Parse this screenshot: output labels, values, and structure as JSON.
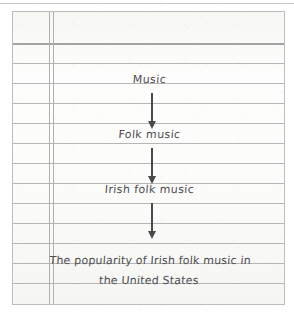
{
  "document": {
    "medium": "scanned lined notebook paper",
    "title_visible": false
  },
  "paper": {
    "ruled_line_count": 13,
    "ruled_line_spacing_px": 20,
    "first_rule_y_px": 31,
    "margin": {
      "style": "double vertical line",
      "x_positions_px": [
        36,
        40
      ]
    },
    "ink_color": "#4d4d52",
    "rule_color": "#b6b6b6",
    "paper_color": "#fdfdfc",
    "border_color": "#bdbdbd"
  },
  "diagram": {
    "type": "vertical-flow",
    "direction": "top-to-bottom narrowing of topic",
    "nodes": [
      {
        "id": "n1",
        "text": "Music"
      },
      {
        "id": "n2",
        "text": "Folk music"
      },
      {
        "id": "n3",
        "text": "Irish folk music"
      },
      {
        "id": "n4",
        "text": "The popularity of Irish folk music in\nthe United States"
      }
    ],
    "connectors": [
      {
        "id": "a1",
        "from": "n1",
        "to": "n2",
        "glyph": "down-arrow"
      },
      {
        "id": "a2",
        "from": "n2",
        "to": "n3",
        "glyph": "down-arrow"
      },
      {
        "id": "a3",
        "from": "n3",
        "to": "n4",
        "glyph": "down-arrow"
      }
    ]
  }
}
